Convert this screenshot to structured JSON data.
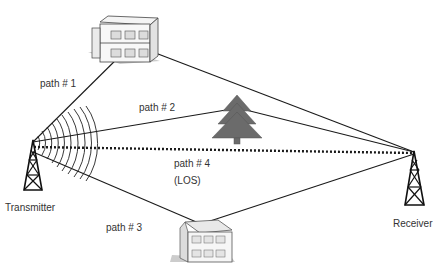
{
  "diagram": {
    "type": "multipath-propagation",
    "nodes": {
      "transmitter": {
        "label": "Transmitter"
      },
      "receiver": {
        "label": "Receiver"
      },
      "building_top": {
        "label": ""
      },
      "building_bottom": {
        "label": ""
      },
      "tree": {
        "label": ""
      }
    },
    "paths": [
      {
        "id": "path1",
        "label": "path # 1",
        "via": "building_top",
        "style": "solid"
      },
      {
        "id": "path2",
        "label": "path # 2",
        "via": "tree",
        "style": "solid"
      },
      {
        "id": "path3",
        "label": "path # 3",
        "via": "building_bottom",
        "style": "solid"
      },
      {
        "id": "path4",
        "label": "path # 4",
        "sublabel": "(LOS)",
        "via": "direct",
        "style": "dotted"
      }
    ],
    "colors": {
      "line": "#1a1a1a",
      "tree": "#6b6b6b",
      "building_wall": "#f2f2f2",
      "building_edge": "#444444",
      "text": "#333333"
    }
  }
}
